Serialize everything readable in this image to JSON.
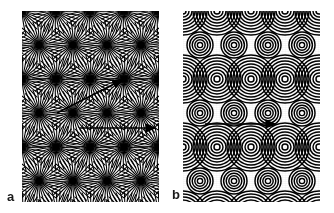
{
  "figure": {
    "title": "",
    "background_color": "#ffffff",
    "width": 334,
    "height": 213,
    "ink_color": "#000000"
  },
  "panels": [
    {
      "id": "a",
      "label": "a",
      "label_position": "bottom-left-outside",
      "pattern_type": "radial-star-burst-moire",
      "description": "Moire interference pattern of radial line bursts emanating from lattice point sources",
      "frame": {
        "x": 22,
        "y": 11,
        "width": 137,
        "height": 191
      },
      "lattice": {
        "type": "staggered-rectangular",
        "spacing_x": 34,
        "spacing_y": 34,
        "row_offset_x": 17,
        "columns": 5,
        "rows": 7
      },
      "motif": {
        "kind": "radial-rays",
        "ray_count": 36,
        "inner_radius": 0,
        "outer_radius": 24,
        "core_radius": 3.5,
        "stroke_color": "#000000"
      },
      "annotations": [
        {
          "kind": "arrow",
          "name": "diagonal-vector-arrow",
          "x1": 57,
          "y1": 113,
          "x2": 122,
          "y2": 80,
          "label": ""
        },
        {
          "kind": "arrow",
          "name": "horizontal-vector-arrow",
          "x1": 80,
          "y1": 128,
          "x2": 155,
          "y2": 128,
          "label": ""
        }
      ]
    },
    {
      "id": "b",
      "label": "b",
      "label_position": "bottom-left-outside",
      "pattern_type": "concentric-circles-moire",
      "description": "Moire interference pattern of concentric ring sets on a staggered lattice with alternating large and small ring clusters",
      "frame": {
        "x": 183,
        "y": 11,
        "width": 137,
        "height": 191
      },
      "lattice": {
        "type": "staggered-rectangular",
        "spacing_x": 34,
        "spacing_y": 34,
        "row_offset_x": 17,
        "columns": 5,
        "rows": 7
      },
      "motif": {
        "kind": "concentric-rings",
        "ring_count_large": 8,
        "ring_count_small": 5,
        "ring_spacing": 3.1,
        "max_radius_large": 24,
        "max_radius_small": 13,
        "stroke_color": "#000000"
      },
      "annotations": [
        {
          "kind": "arrow",
          "name": "horizontal-vector-arrow",
          "x1": 205,
          "y1": 124,
          "x2": 275,
          "y2": 124,
          "label": ""
        }
      ]
    }
  ]
}
